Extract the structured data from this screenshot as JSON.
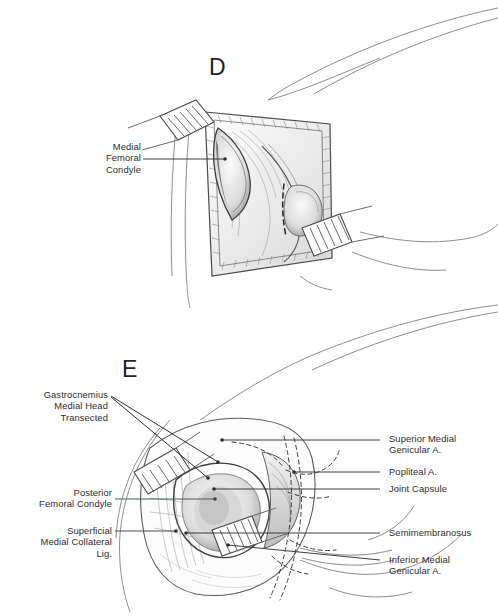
{
  "figure": {
    "background_color": "#ffffff",
    "ink_color": "#3a3a3a",
    "text_color": "#2b2b2b",
    "leader_color": "#3d3d3d",
    "leader_color_green": "#3f5f4a"
  },
  "panels": [
    {
      "letter": "D",
      "caption": "Superficial exposure showing medial femoral condyle through the arthrotomy window"
    },
    {
      "letter": "E",
      "caption": "Deep exposure after transection of the medial head of gastrocnemius"
    }
  ],
  "panel_d": {
    "letter": "D",
    "labels": [
      {
        "name": "medial-femoral-condyle",
        "text": "Medial\nFemoral\nCondyle",
        "align": "right"
      }
    ]
  },
  "panel_e": {
    "letter": "E",
    "labels_left": [
      {
        "name": "gastrocnemius-medial-head-transected",
        "text": "Gastrocnemius\nMedial Head\nTransected",
        "align": "right"
      },
      {
        "name": "posterior-femoral-condyle",
        "text": "Posterior\nFemoral Condyle",
        "align": "right"
      },
      {
        "name": "superficial-medial-collateral-lig",
        "text": "Superficial\nMedial Collateral\nLig.",
        "align": "right"
      }
    ],
    "labels_right": [
      {
        "name": "superior-medial-genicular-artery",
        "text": "Superior Medial\nGenicular A.",
        "align": "left"
      },
      {
        "name": "popliteal-artery",
        "text": "Popliteal A.",
        "align": "left"
      },
      {
        "name": "joint-capsule",
        "text": "Joint Capsule",
        "align": "left"
      },
      {
        "name": "semimembranosus",
        "text": "Semimembranosus",
        "align": "left"
      },
      {
        "name": "inferior-medial-genicular-artery",
        "text": "Inferior Medial\nGenicular A.",
        "align": "left"
      }
    ]
  }
}
